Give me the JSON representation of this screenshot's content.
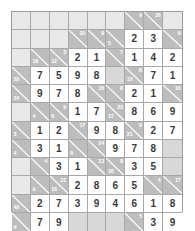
{
  "puzzle": {
    "name": "kakuro-grid",
    "type": "kakuro",
    "columns": 9,
    "rows": 11,
    "colors": {
      "clue_cell": "#bdbdbd",
      "answer_cell": "#ffffff",
      "empty_cell": "#e8e8e8",
      "blank_cell": "#d8d8d8",
      "grid_line": "#a8a8a8",
      "clue_text": "#ffffff",
      "digit_text": "#3a3a3a"
    },
    "cells": [
      [
        {
          "kind": "empty"
        },
        {
          "kind": "empty"
        },
        {
          "kind": "empty"
        },
        {
          "kind": "empty"
        },
        {
          "kind": "empty"
        },
        {
          "kind": "empty"
        },
        {
          "kind": "clue",
          "down": "",
          "across": "9"
        },
        {
          "kind": "clue",
          "down": "",
          "across": "16"
        },
        {
          "kind": "empty"
        }
      ],
      [
        {
          "kind": "empty"
        },
        {
          "kind": "empty"
        },
        {
          "kind": "empty"
        },
        {
          "kind": "clue",
          "down": "",
          "across": "20"
        },
        {
          "kind": "clue",
          "down": "",
          "across": "9"
        },
        {
          "kind": "clue",
          "down": "5",
          "across": ""
        },
        {
          "kind": "answer",
          "value": "2"
        },
        {
          "kind": "answer",
          "value": "3"
        },
        {
          "kind": "clue",
          "down": "",
          "across": "9"
        }
      ],
      [
        {
          "kind": "empty"
        },
        {
          "kind": "clue",
          "down": "18",
          "across": ""
        },
        {
          "kind": "clue",
          "down": "12",
          "across": "3"
        },
        {
          "kind": "answer",
          "value": "2"
        },
        {
          "kind": "answer",
          "value": "1"
        },
        {
          "kind": "clue",
          "down": "",
          "across": "7"
        },
        {
          "kind": "answer",
          "value": "1"
        },
        {
          "kind": "answer",
          "value": "4"
        },
        {
          "kind": "answer",
          "value": "2"
        }
      ],
      [
        {
          "kind": "clue",
          "down": "20",
          "across": ""
        },
        {
          "kind": "answer",
          "value": "7"
        },
        {
          "kind": "answer",
          "value": "5"
        },
        {
          "kind": "answer",
          "value": "9"
        },
        {
          "kind": "answer",
          "value": "8"
        },
        {
          "kind": "blank"
        },
        {
          "kind": "clue",
          "down": "10",
          "across": "8"
        },
        {
          "kind": "answer",
          "value": "7"
        },
        {
          "kind": "answer",
          "value": "1"
        }
      ],
      [
        {
          "kind": "clue",
          "down": "24",
          "across": ""
        },
        {
          "kind": "answer",
          "value": "9"
        },
        {
          "kind": "answer",
          "value": "7"
        },
        {
          "kind": "answer",
          "value": "8"
        },
        {
          "kind": "clue",
          "down": "",
          "across": "16"
        },
        {
          "kind": "clue",
          "down": "",
          "across": "8"
        },
        {
          "kind": "answer",
          "value": "2"
        },
        {
          "kind": "answer",
          "value": "1"
        },
        {
          "kind": "clue",
          "down": "",
          "across": "16"
        }
      ],
      [
        {
          "kind": "empty"
        },
        {
          "kind": "clue",
          "down": "4",
          "across": ""
        },
        {
          "kind": "clue",
          "down": "6",
          "across": "9"
        },
        {
          "kind": "answer",
          "value": "1"
        },
        {
          "kind": "answer",
          "value": "7"
        },
        {
          "kind": "clue",
          "down": "17",
          "across": "23"
        },
        {
          "kind": "answer",
          "value": "8"
        },
        {
          "kind": "answer",
          "value": "6"
        },
        {
          "kind": "answer",
          "value": "9"
        }
      ],
      [
        {
          "kind": "clue",
          "down": "3",
          "across": ""
        },
        {
          "kind": "answer",
          "value": "1"
        },
        {
          "kind": "answer",
          "value": "2"
        },
        {
          "kind": "clue",
          "down": "",
          "across": "17"
        },
        {
          "kind": "answer",
          "value": "9"
        },
        {
          "kind": "answer",
          "value": "8"
        },
        {
          "kind": "clue",
          "down": "21",
          "across": "9"
        },
        {
          "kind": "answer",
          "value": "2"
        },
        {
          "kind": "answer",
          "value": "7"
        }
      ],
      [
        {
          "kind": "clue",
          "down": "4",
          "across": ""
        },
        {
          "kind": "answer",
          "value": "3"
        },
        {
          "kind": "answer",
          "value": "1"
        },
        {
          "kind": "clue",
          "down": "6",
          "across": ""
        },
        {
          "kind": "clue",
          "down": "",
          "across": "24"
        },
        {
          "kind": "answer",
          "value": "9"
        },
        {
          "kind": "answer",
          "value": "7"
        },
        {
          "kind": "answer",
          "value": "8"
        },
        {
          "kind": "blank"
        }
      ],
      [
        {
          "kind": "empty"
        },
        {
          "kind": "clue",
          "down": "",
          "across": "4"
        },
        {
          "kind": "answer",
          "value": "3"
        },
        {
          "kind": "answer",
          "value": "1"
        },
        {
          "kind": "clue",
          "down": "",
          "across": "13"
        },
        {
          "kind": "clue",
          "down": "16",
          "across": "8"
        },
        {
          "kind": "answer",
          "value": "3"
        },
        {
          "kind": "answer",
          "value": "5"
        },
        {
          "kind": "blank"
        }
      ],
      [
        {
          "kind": "empty"
        },
        {
          "kind": "clue",
          "down": "9",
          "across": ""
        },
        {
          "kind": "clue",
          "down": "16",
          "across": "21"
        },
        {
          "kind": "answer",
          "value": "2"
        },
        {
          "kind": "answer",
          "value": "8"
        },
        {
          "kind": "answer",
          "value": "6"
        },
        {
          "kind": "answer",
          "value": "5"
        },
        {
          "kind": "clue",
          "down": "",
          "across": "4"
        },
        {
          "kind": "clue",
          "down": "",
          "across": "17"
        }
      ],
      [
        {
          "kind": "clue",
          "down": "40",
          "across": ""
        },
        {
          "kind": "answer",
          "value": "2"
        },
        {
          "kind": "answer",
          "value": "7"
        },
        {
          "kind": "answer",
          "value": "3"
        },
        {
          "kind": "answer",
          "value": "9"
        },
        {
          "kind": "answer",
          "value": "4"
        },
        {
          "kind": "answer",
          "value": "6"
        },
        {
          "kind": "answer",
          "value": "1"
        },
        {
          "kind": "answer",
          "value": "8"
        }
      ],
      [
        {
          "kind": "clue",
          "down": "9",
          "across": ""
        },
        {
          "kind": "answer",
          "value": "7"
        },
        {
          "kind": "answer",
          "value": "9"
        },
        {
          "kind": "blank"
        },
        {
          "kind": "blank"
        },
        {
          "kind": "blank"
        },
        {
          "kind": "clue",
          "down": "",
          "across": "5"
        },
        {
          "kind": "answer",
          "value": "3"
        },
        {
          "kind": "answer",
          "value": "9"
        }
      ]
    ]
  }
}
